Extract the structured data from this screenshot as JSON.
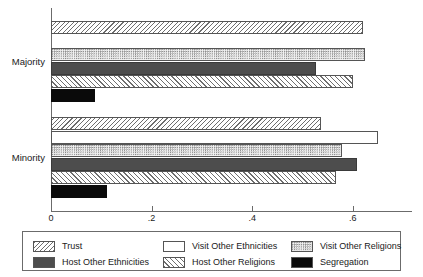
{
  "chart_data": {
    "type": "bar",
    "orientation": "horizontal",
    "title": "",
    "xlabel": "",
    "ylabel": "",
    "xlim": [
      0,
      0.72
    ],
    "grid": false,
    "legend_position": "bottom",
    "categories": [
      "Majority",
      "Minority"
    ],
    "xticks": [
      {
        "value": 0,
        "label": "0"
      },
      {
        "value": 0.2,
        "label": ".2"
      },
      {
        "value": 0.4,
        "label": ".4"
      },
      {
        "value": 0.6,
        "label": ".6"
      }
    ],
    "series": [
      {
        "name": "Trust",
        "pattern": "diagonal-backslash-hatch",
        "values": [
          0.62,
          0.537
        ]
      },
      {
        "name": "Visit Other Ethnicities",
        "pattern": "empty-white",
        "values": [
          0.0,
          0.651
        ]
      },
      {
        "name": "Visit Other Religions",
        "pattern": "dot-stipple",
        "values": [
          0.625,
          0.578
        ]
      },
      {
        "name": "Host Other Ethnicities",
        "pattern": "solid-dark-gray",
        "values": [
          0.527,
          0.608
        ]
      },
      {
        "name": "Host Other Religions",
        "pattern": "diagonal-slash-hatch",
        "values": [
          0.601,
          0.567
        ]
      },
      {
        "name": "Segregation",
        "pattern": "solid-black",
        "values": [
          0.087,
          0.111
        ]
      }
    ]
  },
  "axis": {
    "group_labels": [
      "Majority",
      "Minority"
    ],
    "tick_labels": [
      "0",
      ".2",
      ".4",
      ".6"
    ]
  },
  "legend": {
    "items": [
      {
        "label": "Trust",
        "pattern": "pat-trust"
      },
      {
        "label": "Visit Other Ethnicities",
        "pattern": "pat-visit-eth"
      },
      {
        "label": "Visit Other Religions",
        "pattern": "pat-visit-rel"
      },
      {
        "label": "Host Other Ethnicities",
        "pattern": "pat-host-eth"
      },
      {
        "label": "Host Other Religions",
        "pattern": "pat-host-rel"
      },
      {
        "label": "Segregation",
        "pattern": "pat-seg"
      }
    ]
  },
  "colors": {
    "axis": "#6b6b6b",
    "text": "#1a1a1a",
    "dark_gray": "#4d4d4d",
    "black": "#0a0a0a",
    "hatch": "#6e6e6e"
  }
}
